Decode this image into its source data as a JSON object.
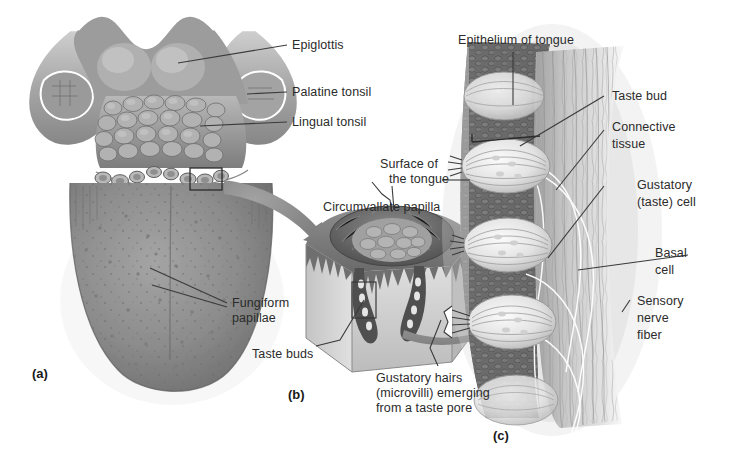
{
  "figure": {
    "background_color": "#ffffff",
    "text_color": "#2b2b2b",
    "leader_color": "#3a3a3a"
  },
  "panels": [
    {
      "id": "a",
      "letter": "(a)",
      "caption": "Dorsal surface of the tongue"
    },
    {
      "id": "b",
      "letter": "(b)",
      "caption": "Circumvallate papilla section"
    },
    {
      "id": "c",
      "letter": "(c)",
      "caption": "Taste bud microstructure"
    }
  ],
  "labels": {
    "epiglottis": "Epiglottis",
    "palatine_tonsil": "Palatine tonsil",
    "lingual_tonsil": "Lingual tonsil",
    "fungiform_papillae_line1": "Fungiform",
    "fungiform_papillae_line2": "papillae",
    "surface_of_tongue_line1": "Surface of",
    "surface_of_tongue_line2": "the tongue",
    "circumvallate_papilla": "Circumvallate papilla",
    "taste_buds": "Taste buds",
    "gustatory_hairs_line1": "Gustatory hairs",
    "gustatory_hairs_line2": "(microvilli) emerging",
    "gustatory_hairs_line3": "from a taste pore",
    "epithelium_of_tongue": "Epithelium of tongue",
    "taste_bud": "Taste bud",
    "connective_tissue_line1": "Connective",
    "connective_tissue_line2": "tissue",
    "gustatory_cell_line1": "Gustatory",
    "gustatory_cell_line2": "(taste) cell",
    "basal_cell_line1": "Basal",
    "basal_cell_line2": "cell",
    "sensory_nerve_fiber_line1": "Sensory",
    "sensory_nerve_fiber_line2": "nerve",
    "sensory_nerve_fiber_line3": "fiber"
  },
  "colors": {
    "tongue_body": "#8e8e8e",
    "tongue_body_dark": "#6f6f6f",
    "tongue_body_light": "#a8a8a8",
    "tonsil": "#9a9a9a",
    "tonsil_shade": "#707070",
    "epiglottis": "#b5b5b5",
    "arrow": "#8c8c8c",
    "papilla_block_top": "#7a7a7a",
    "papilla_block_side": "#c9c9c9",
    "papilla_block_front": "#d8d8d8",
    "epithelium_c": "#6a6a6a",
    "epithelium_c_cells": "#545454",
    "taste_bud_fill": "#f2f2f2",
    "connective": "#bdbdbd",
    "outline": "#3a3a3a",
    "white_outline": "#ffffff"
  }
}
